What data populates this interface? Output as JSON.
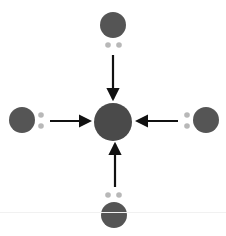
{
  "diagram": {
    "type": "coordination-bonding",
    "colors": {
      "center_atom": "#4a4a4a",
      "ligand_atom": "#555555",
      "lone_pair": "#b8b8b8",
      "arrow": "#111111",
      "background": "#ffffff"
    },
    "center": {
      "x": 113,
      "y": 122,
      "r": 19
    },
    "ligands": [
      {
        "name": "top",
        "x": 113,
        "y": 25,
        "r": 13,
        "pair": [
          {
            "x": 108,
            "y": 45
          },
          {
            "x": 119,
            "y": 45
          }
        ],
        "arrow": {
          "x1": 113,
          "y1": 55,
          "x2": 113,
          "y2": 99
        }
      },
      {
        "name": "left",
        "x": 22,
        "y": 120,
        "r": 13,
        "pair": [
          {
            "x": 41,
            "y": 115
          },
          {
            "x": 41,
            "y": 126
          }
        ],
        "arrow": {
          "x1": 50,
          "y1": 121,
          "x2": 90,
          "y2": 121
        }
      },
      {
        "name": "right",
        "x": 206,
        "y": 120,
        "r": 13,
        "pair": [
          {
            "x": 187,
            "y": 115
          },
          {
            "x": 187,
            "y": 126
          }
        ],
        "arrow": {
          "x1": 178,
          "y1": 121,
          "x2": 137,
          "y2": 121
        }
      },
      {
        "name": "bottom",
        "x": 114,
        "y": 215,
        "r": 13,
        "pair": [
          {
            "x": 108,
            "y": 195
          },
          {
            "x": 119,
            "y": 195
          }
        ],
        "arrow": {
          "x1": 115,
          "y1": 187,
          "x2": 115,
          "y2": 144
        }
      }
    ]
  }
}
